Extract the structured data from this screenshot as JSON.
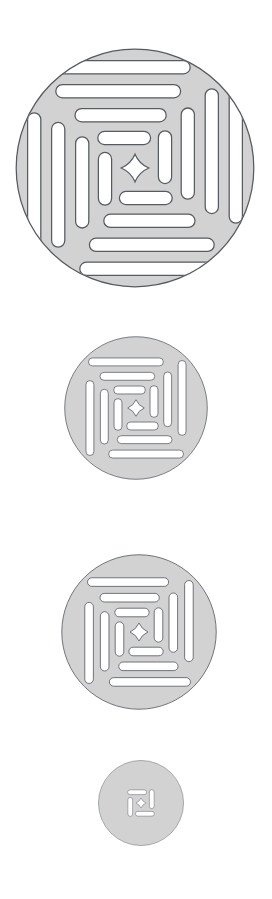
{
  "canvas": {
    "width": 272,
    "height": 899,
    "background": "#ffffff"
  },
  "style": {
    "fill": "#d2d2d2",
    "stroke": "#555b60",
    "cutout": "#ffffff",
    "stroke_width_ratio": 0.0045
  },
  "artwork": {
    "name": "concentric-spiral-seal-glyph",
    "description": "Four nested circular seal glyphs of decreasing size, each a filled light-grey disc with white pinwheel-arranged rounded-bar cutouts forming concentric square rings around a central four-pointed star.",
    "motif": "pinwheel-ring-seal",
    "center_ornament": "four-pointed-star",
    "ring_count_largest": 4,
    "bar_shape": "rounded-bar",
    "rotation_per_ring_degrees": 0
  },
  "icons": [
    {
      "id": "icon-xl",
      "label": "Seal glyph extra large",
      "cx": 135,
      "cy": 168,
      "radius": 120,
      "rings": 4,
      "size_label": "XL"
    },
    {
      "id": "icon-lg",
      "label": "Seal glyph large",
      "cx": 136,
      "cy": 408,
      "radius": 72,
      "rings": 3,
      "size_label": "L"
    },
    {
      "id": "icon-md",
      "label": "Seal glyph medium",
      "cx": 139,
      "cy": 632,
      "radius": 78,
      "rings": 3,
      "size_label": "M"
    },
    {
      "id": "icon-sm",
      "label": "Seal glyph small",
      "cx": 141,
      "cy": 803,
      "radius": 43,
      "rings": 1,
      "size_label": "S"
    }
  ]
}
